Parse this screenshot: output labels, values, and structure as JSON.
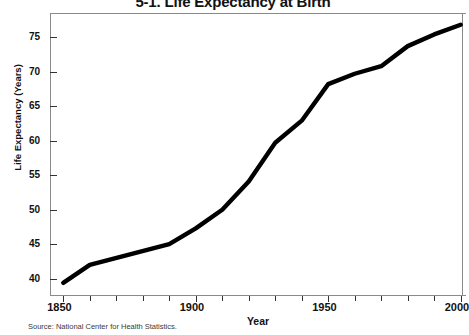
{
  "chart_data": {
    "type": "line",
    "title": "5-1. Life Expectancy at Birth",
    "xlabel": "Year",
    "ylabel": "Life Expectancy (Years)",
    "xlim": [
      1845,
      2002
    ],
    "ylim": [
      37.5,
      78.5
    ],
    "grid": false,
    "legend": null,
    "x_ticks_major": [
      1850,
      1900,
      1950,
      2000
    ],
    "x_ticks_minor": [
      1860,
      1870,
      1880,
      1890,
      1910,
      1920,
      1930,
      1940,
      1960,
      1970,
      1980,
      1990
    ],
    "y_ticks": [
      40,
      45,
      50,
      55,
      60,
      65,
      70,
      75
    ],
    "series": [
      {
        "name": "Life expectancy at birth",
        "color": "#000000",
        "x": [
          1850,
          1860,
          1890,
          1900,
          1910,
          1920,
          1930,
          1940,
          1950,
          1960,
          1970,
          1980,
          1990,
          2000
        ],
        "values": [
          39.4,
          42.0,
          45.0,
          47.3,
          50.0,
          54.1,
          59.7,
          62.9,
          68.2,
          69.7,
          70.8,
          73.7,
          75.4,
          76.8
        ]
      }
    ],
    "annotations": [],
    "source": "Source: National Center for Health Statistics."
  },
  "axis": {
    "y_tick_labels": [
      "75",
      "70",
      "65",
      "60",
      "55",
      "50",
      "45",
      "40"
    ],
    "x_tick_labels": [
      "1850",
      "1900",
      "1950",
      "2000"
    ]
  },
  "footer": {
    "source": "Source: National Center for Health Statistics."
  }
}
